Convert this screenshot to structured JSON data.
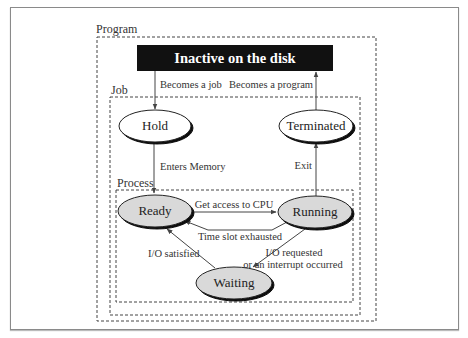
{
  "diagram": {
    "containers": {
      "program": {
        "label": "Program"
      },
      "job": {
        "label": "Job"
      },
      "process": {
        "label": "Process"
      }
    },
    "disk_box": {
      "label": "Inactive on the disk"
    },
    "states": {
      "hold": {
        "label": "Hold"
      },
      "terminated": {
        "label": "Terminated"
      },
      "ready": {
        "label": "Ready"
      },
      "running": {
        "label": "Running"
      },
      "waiting": {
        "label": "Waiting"
      }
    },
    "transitions": {
      "becomes_job": "Becomes a job",
      "becomes_program": "Becomes a program",
      "enters_memory": "Enters Memory",
      "exit": "Exit",
      "get_cpu": "Get access to CPU",
      "time_slot": "Time slot exhausted",
      "io_satisfied": "I/O satisfied",
      "io_requested_line1": "I/O requested",
      "io_requested_line2": "or an interrupt occurred"
    },
    "colors": {
      "active_state_fill": "#d9d9d9",
      "inactive_state_fill": "#ffffff",
      "disk_box_fill": "#111111",
      "line": "#444444"
    }
  }
}
